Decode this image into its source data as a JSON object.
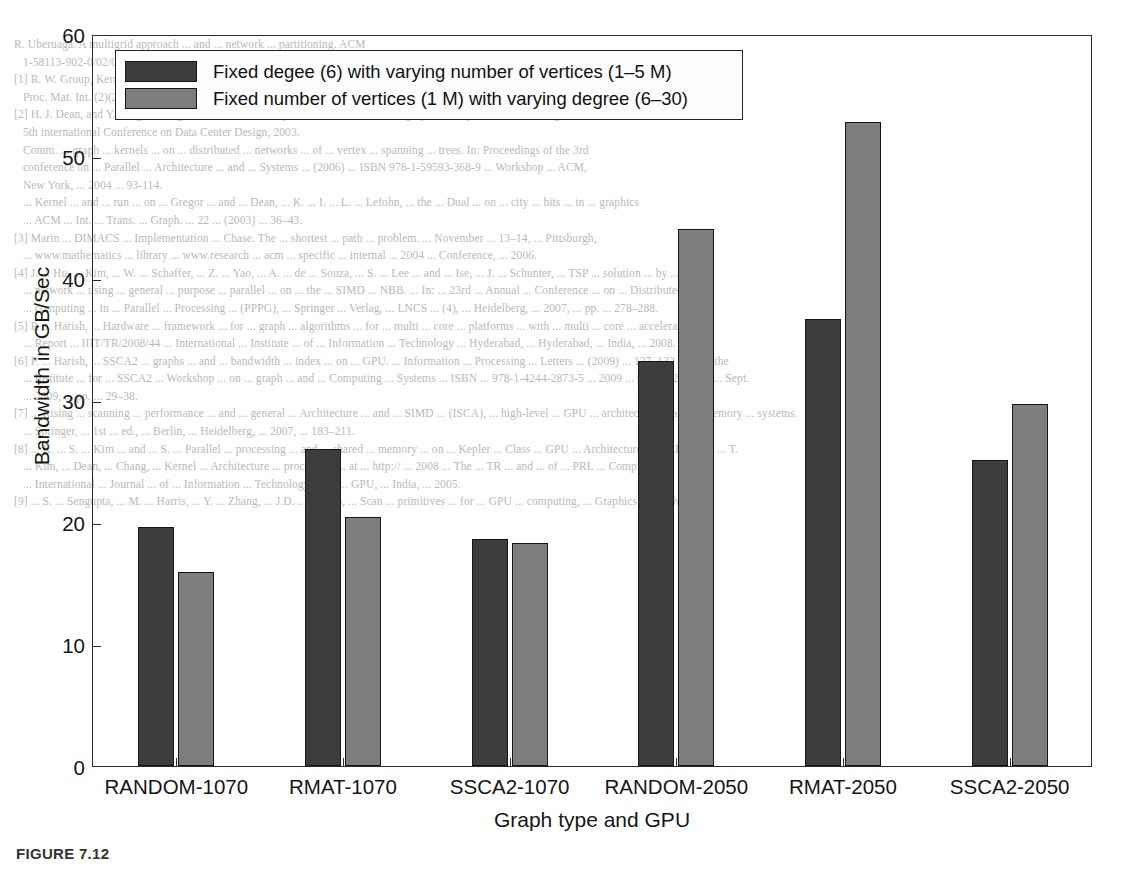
{
  "figure": {
    "caption": "FIGURE 7.12",
    "legend": {
      "items": [
        {
          "label": "Fixed  degee (6) with varying number of vertices (1–5 M)",
          "swatch": "dark-swatch",
          "color": "#3d3d3d"
        },
        {
          "label": "Fixed number of vertices (1 M) with varying degree (6–30)",
          "swatch": "light-swatch",
          "color": "#7d7d7d"
        }
      ]
    }
  },
  "chart_data": {
    "type": "bar",
    "title": "",
    "xlabel": "Graph type and GPU",
    "ylabel": "Bandwidth in GB/Sec",
    "ylim": [
      0,
      60
    ],
    "yticks": [
      0,
      10,
      20,
      30,
      40,
      50,
      60
    ],
    "ytick_labels": [
      "0",
      "10",
      "20",
      "30",
      "40",
      "50",
      "60"
    ],
    "grid": false,
    "legend_position": "top-left",
    "categories": [
      "RANDOM-1070",
      "RMAT-1070",
      "SSCA2-1070",
      "RANDOM-2050",
      "RMAT-2050",
      "SSCA2-2050"
    ],
    "series": [
      {
        "name": "Fixed  degee (6) with varying number of vertices (1–5 M)",
        "color": "#3d3d3d",
        "values": [
          19.6,
          26.0,
          18.6,
          33.2,
          36.6,
          25.1
        ]
      },
      {
        "name": "Fixed number of vertices (1 M) with varying degree (6–30)",
        "color": "#7d7d7d",
        "values": [
          15.9,
          20.4,
          18.3,
          44.0,
          52.8,
          29.7
        ]
      }
    ]
  },
  "background_page": {
    "lines": [
      "R. Uberuaga. A multigrid approach ... and ... network ... partitioning. ACM",
      "   1-58113-902-0/02/0006 ...",
      "[1] R. W. Group, Kernel ... Comp. ... Comm. ... graph ... and ... sparse ... algorithms.",
      "   Proc. Mat. Int. (2)(2006) ... 1233.",
      "[2] H. J. Dean, and Y. Peng, C. Ferguson, R. SACE. A ... performance ... model for graph ... analysis. In: Proceedings of the",
      "   5th international Conference on Data Center Design, 2003.",
      "   Comm. ... graph ... kernels ... on ... distributed ... networks ... of ... vertex ... spanning ... trees. In: Proceedings of the 3rd",
      "   conference on ... Parallel ... Architecture ... and ... Systems ... (2006) ... ISBN 978-1-59593-368-9 ... Workshop ... ACM,",
      "   New York, ... 2004 ... 93-114.",
      "   ... Kernel ... and ... run ... on ... Gregor ... and ... Dean, ... K. ... I. ... L. ... Lefohn, ... the ... Dual ... on ... city ... bits ... in ... graphics",
      "   ... ACM ... Int. ... Trans. ... Graph. ... 22 ... (2003) ... 36–43.",
      "[3] Marin ... DIMACS ... Implementation ... Chase. The ... shortest ... path ... problem. ... November ... 13–14, ... Pittsburgh,",
      "   ... www.mathematics ... library ... www.research ... acm ... specific ... internal ... 2004 ... Conference, ... 2006.",
      "[4] J. ... Hu, ... Kim, ... W. ... Schaffer, ... Z. ... Yao, ... A. ... de ... Souza, ... S. ... Lee ... and ... Ise, ... J. ... Schunter, ... TSP ... solution ... by ... SSD",
      "   ... network ... using ... general ... purpose ... parallel ... on ... the ... SIMD ... NBB. ... In: ... 23rd ... Annual ... Conference ... on ... Distributed",
      "   ... computing ... in ... Parallel ... Processing ... (PPPG), ... Springer ... Verlag, ... LNCS ... (4), ... Heidelberg, ... 2007, ... pp. ... 278–288.",
      "[5] P. ... Harish, ... Hardware ... framework ... for ... graph ... algorithms ... for ... multi ... core ... platforms ... with ... multi ... core ... accelerators.",
      "   ... Report ... IIIT/TR/2008/44 ... International ... Institute ... of ... Information ... Technology ... Hyderabad, ... Hyderabad, ... India, ... 2008.",
      "[6] P. ... Harish, ... SSCA2 ... graphs ... and ... bandwidth ... index ... on ... GPU. ... Information ... Processing ... Letters ... (2009) ... 127–132 ... of ... the",
      "   ... Institute ... for ... SSCA2 ... Workshop ... on ... graph ... and ... Computing ... Systems ... ISBN ... 978-1-4244-2873-5 ... 2009 ... pp. ... 226–231, ... Sept.",
      "   ... 2009, ... pp. ... 29–38.",
      "[7] ... Rising ... scanning ... performance ... and ... general ... Architecture ... and ... SIMD ... (ISCA), ... high-level ... GPU ... architecture ... and ... memory ... systems.",
      "   ... Springer, ... 1st ... ed., ... Berlin, ... Heidelberg, ... 2007, ... 183–211.",
      "[8] ... K. ... S. ... Kim ... and ... S. ... Parallel ... processing ... and ... shared ... memory ... on ... Kepler ... Class ... GPU ... Architectures. ... IEEE ... V. ... T.",
      "   ... Kim, ... Dean, ... Chang, ... Kernel ... Architecture ... processing ... at ... http:// ... 2008 ... The ... TR ... and ... of ... PRL ... Compiler",
      "   ... International ... Journal ... of ... Information ... Technology ... on ... GPU, ... India, ... 2005.",
      "[9] ... S. ... Sengupta, ... M. ... Harris, ... Y. ... Zhang, ... J.D. ... Owens, ... Scan ... primitives ... for ... GPU ... computing, ... Graphics ... Hardware,"
    ]
  }
}
